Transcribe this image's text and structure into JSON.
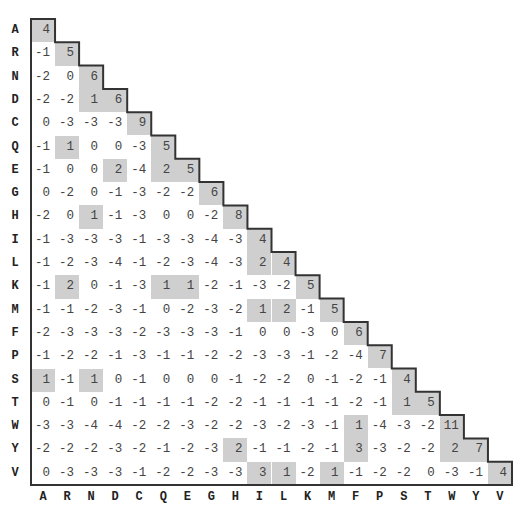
{
  "amino_acids": [
    "A",
    "R",
    "N",
    "D",
    "C",
    "Q",
    "E",
    "G",
    "H",
    "I",
    "L",
    "K",
    "M",
    "F",
    "P",
    "S",
    "T",
    "W",
    "Y",
    "V"
  ],
  "matrix": [
    [
      4
    ],
    [
      -1,
      5
    ],
    [
      -2,
      0,
      6
    ],
    [
      -2,
      -2,
      1,
      6
    ],
    [
      0,
      -3,
      -3,
      -3,
      9
    ],
    [
      -1,
      1,
      0,
      0,
      -3,
      5
    ],
    [
      -1,
      0,
      0,
      2,
      -4,
      2,
      5
    ],
    [
      0,
      -2,
      0,
      -1,
      -3,
      -2,
      -2,
      6
    ],
    [
      -2,
      0,
      1,
      -1,
      -3,
      0,
      0,
      -2,
      8
    ],
    [
      -1,
      -3,
      -3,
      -3,
      -1,
      -3,
      -3,
      -4,
      -3,
      4
    ],
    [
      -1,
      -2,
      -3,
      -4,
      -1,
      -2,
      -3,
      -4,
      -3,
      2,
      4
    ],
    [
      -1,
      2,
      0,
      -1,
      -3,
      1,
      1,
      -2,
      -1,
      -3,
      -2,
      5
    ],
    [
      -1,
      -1,
      -2,
      -3,
      -1,
      0,
      -2,
      -3,
      -2,
      1,
      2,
      -1,
      5
    ],
    [
      -2,
      -3,
      -3,
      -3,
      -2,
      -3,
      -3,
      -3,
      -1,
      0,
      0,
      -3,
      0,
      6
    ],
    [
      -1,
      -2,
      -2,
      -1,
      -3,
      -1,
      -1,
      -2,
      -2,
      -3,
      -3,
      -1,
      -2,
      -4,
      7
    ],
    [
      1,
      -1,
      1,
      0,
      -1,
      0,
      0,
      0,
      -1,
      -2,
      -2,
      0,
      -1,
      -2,
      -1,
      4
    ],
    [
      0,
      -1,
      0,
      -1,
      -1,
      -1,
      -1,
      -2,
      -2,
      -1,
      -1,
      -1,
      -1,
      -2,
      -1,
      1,
      5
    ],
    [
      -3,
      -3,
      -4,
      -4,
      -2,
      -2,
      -3,
      -2,
      -2,
      -3,
      -2,
      -3,
      -1,
      1,
      -4,
      -3,
      -2,
      11
    ],
    [
      -2,
      -2,
      -2,
      -3,
      -2,
      -1,
      -2,
      -3,
      2,
      -1,
      -1,
      -2,
      -1,
      3,
      -3,
      -2,
      -2,
      2,
      7
    ],
    [
      0,
      -3,
      -3,
      -3,
      -1,
      -2,
      -2,
      -3,
      -3,
      3,
      1,
      -2,
      1,
      -1,
      -2,
      -2,
      0,
      -3,
      -1,
      4
    ]
  ],
  "shade_rule": "diagonal and positive off-diagonal scores are shaded",
  "colors": {
    "shade": "#cfcfcf",
    "text": "#444444",
    "outline": "#333333"
  }
}
